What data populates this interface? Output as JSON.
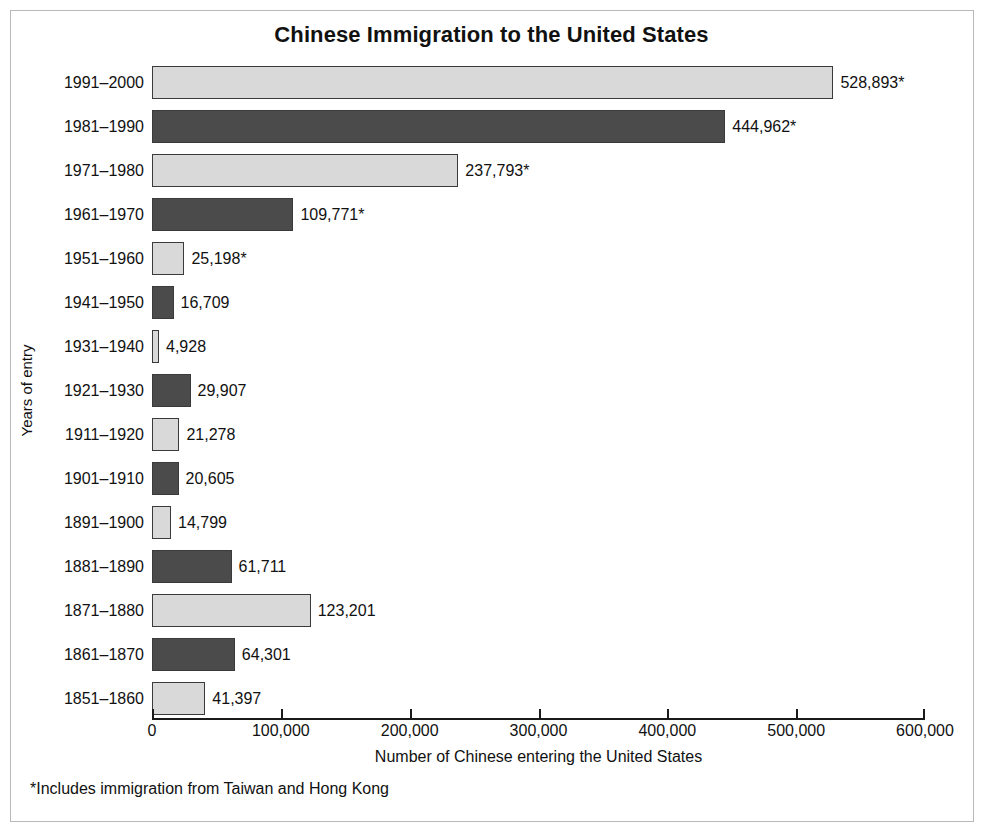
{
  "chart_data": {
    "type": "bar",
    "orientation": "horizontal",
    "title": "Chinese Immigration to the United States",
    "xlabel": "Number of Chinese entering the United States",
    "ylabel": "Years of entry",
    "xlim": [
      0,
      600000
    ],
    "xticks": [
      0,
      100000,
      200000,
      300000,
      400000,
      500000,
      600000
    ],
    "xtick_labels": [
      "0",
      "100,000",
      "200,000",
      "300,000",
      "400,000",
      "500,000",
      "600,000"
    ],
    "grid": false,
    "legend": false,
    "footnote": "*Includes immigration from Taiwan and Hong Kong",
    "colors": {
      "light_bar": "#d9d9d9",
      "dark_bar": "#4b4b4b",
      "bar_outline": "#3a3a3a",
      "text": "#111111",
      "frame": "#b9b9b9",
      "axis": "#1a1a1a"
    },
    "categories": [
      "1991–2000",
      "1981–1990",
      "1971–1980",
      "1961–1970",
      "1951–1960",
      "1941–1950",
      "1931–1940",
      "1921–1930",
      "1911–1920",
      "1901–1910",
      "1891–1900",
      "1881–1890",
      "1871–1880",
      "1861–1870",
      "1851–1860"
    ],
    "values": [
      528893,
      444962,
      237793,
      109771,
      25198,
      16709,
      4928,
      29907,
      21278,
      20605,
      14799,
      61711,
      123201,
      64301,
      41397
    ],
    "value_labels": [
      "528,893*",
      "444,962*",
      "237,793*",
      "109,771*",
      "25,198*",
      "16,709",
      "4,928",
      "29,907",
      "21,278",
      "20,605",
      "14,799",
      "61,711",
      "123,201",
      "64,301",
      "41,397"
    ],
    "bar_shades": [
      "light",
      "dark",
      "light",
      "dark",
      "light",
      "dark",
      "light",
      "dark",
      "light",
      "dark",
      "light",
      "dark",
      "light",
      "dark",
      "light"
    ]
  }
}
